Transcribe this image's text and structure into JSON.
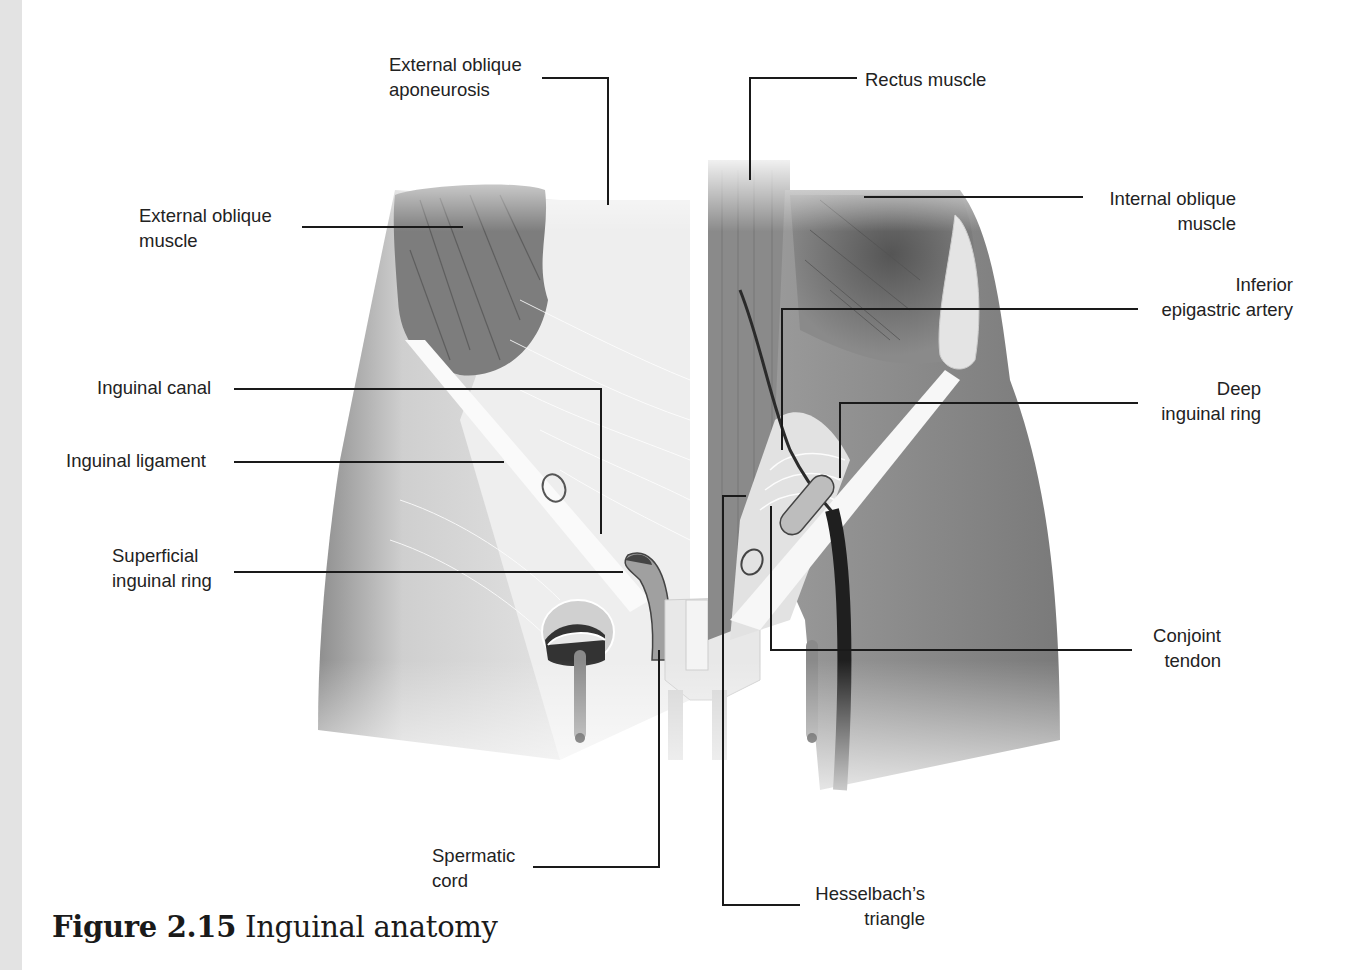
{
  "figure": {
    "caption_number": "Figure 2.15",
    "caption_title": "Inguinal anatomy"
  },
  "labels": {
    "external_oblique_aponeurosis": "External oblique\naponeurosis",
    "external_oblique_muscle": "External oblique\nmuscle",
    "inguinal_canal": "Inguinal canal",
    "inguinal_ligament": "Inguinal ligament",
    "superficial_inguinal_ring": "Superficial\ninguinal ring",
    "spermatic_cord": "Spermatic\ncord",
    "rectus_muscle": "Rectus muscle",
    "internal_oblique_muscle": "Internal oblique\nmuscle",
    "inferior_epigastric_artery": "Inferior\nepigastric artery",
    "deep_inguinal_ring": "Deep\ninguinal ring",
    "conjoint_tendon": "Conjoint\ntendon",
    "hesselbachs_triangle": "Hesselbach’s\ntriangle"
  },
  "colors": {
    "leader_line": "#1a1a1a",
    "muscle_dark": "#6e6e6e",
    "muscle_mid": "#9a9a9a",
    "tissue_light": "#d9d9d9",
    "ligament": "#f4f4f4",
    "margin_strip": "#e3e3e3"
  }
}
